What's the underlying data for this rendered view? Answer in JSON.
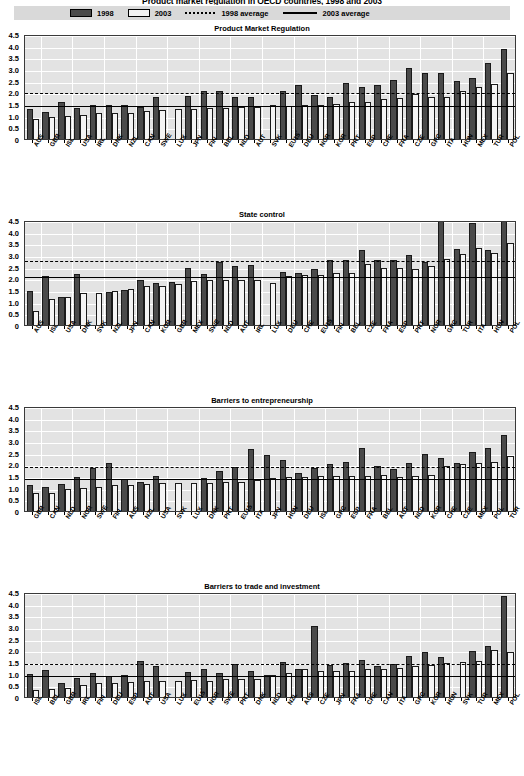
{
  "figure": {
    "title": "Product market regulation in OECD countries, 1998 and 2003",
    "y_ticks": [
      "4.5",
      "4.0",
      "3.5",
      "3.0",
      "2.5",
      "2.0",
      "1.5",
      "1.0",
      "0.5",
      "0"
    ],
    "ylim": [
      0,
      4.5
    ]
  },
  "legend": {
    "items": [
      {
        "key": "bar-1998",
        "label": "1998",
        "swatch": "dark",
        "color": "#4a4a4a"
      },
      {
        "key": "bar-2003",
        "label": "2003",
        "swatch": "light",
        "color": "#f4f4f4"
      },
      {
        "key": "avg-1998",
        "label": "1998 average",
        "swatch": "dash",
        "color": "#000000"
      },
      {
        "key": "avg-2003",
        "label": "2003 average",
        "swatch": "solid",
        "color": "#000000"
      }
    ]
  },
  "chart_data": [
    {
      "type": "bar",
      "title": "Product Market Regulation",
      "xlabel": "",
      "ylabel": "",
      "ylim": [
        0,
        4.5
      ],
      "grid": true,
      "legend_position": "top",
      "categories": [
        "AUS",
        "GBR",
        "ISL",
        "USA",
        "IRL",
        "DNK",
        "NZL",
        "CAN",
        "SWE",
        "LUX",
        "JPN",
        "FIN",
        "BEL",
        "NLD",
        "AUT",
        "SVK",
        "EU15²",
        "DEU",
        "NOR",
        "KOR",
        "PRT",
        "ESP",
        "CHE",
        "FRA",
        "CZE",
        "GRC",
        "ITA",
        "HUN",
        "MEX",
        "TUR",
        "POL"
      ],
      "series": [
        {
          "name": "1998",
          "values": [
            1.28,
            1.15,
            1.58,
            1.31,
            1.46,
            1.47,
            1.45,
            1.37,
            1.79,
            null,
            1.84,
            2.07,
            2.07,
            1.78,
            1.79,
            null,
            2.07,
            2.3,
            1.89,
            1.82,
            2.42,
            2.25,
            2.33,
            2.52,
            3.04,
            2.85,
            2.85,
            2.5,
            2.6,
            3.27,
            3.84
          ],
          "color": "#4a4a4a"
        },
        {
          "name": "2003",
          "values": [
            0.87,
            0.93,
            0.98,
            1.04,
            1.13,
            1.12,
            1.11,
            1.2,
            1.23,
            1.28,
            1.28,
            1.32,
            1.35,
            1.36,
            1.36,
            1.46,
            1.41,
            1.45,
            1.45,
            1.52,
            1.57,
            1.59,
            1.73,
            1.74,
            1.93,
            1.78,
            1.8,
            2.05,
            2.21,
            2.36,
            2.82
          ],
          "color": "#f4f4f4"
        }
      ],
      "avg_1998": 2.07,
      "avg_2003": 1.48
    },
    {
      "type": "bar",
      "title": "State control",
      "xlabel": "",
      "ylabel": "",
      "ylim": [
        0,
        4.5
      ],
      "grid": true,
      "legend_position": "top",
      "categories": [
        "AUS",
        "ISL",
        "USA",
        "DNK",
        "SVK",
        "NZL",
        "JPN",
        "CAN",
        "KOR",
        "GBR",
        "MEX",
        "SWE",
        "NLD",
        "AUT",
        "IRL",
        "LUX",
        "DEU",
        "CHE",
        "EU15²",
        "FIN",
        "BEL",
        "CZE",
        "FRA",
        "ESP",
        "PRT",
        "NOR",
        "GRC",
        "TUR",
        "ITA",
        "HUN",
        "POL"
      ],
      "series": [
        {
          "name": "1998",
          "values": [
            1.44,
            2.12,
            1.22,
            2.17,
            null,
            1.41,
            1.51,
            1.95,
            1.8,
            1.83,
            2.45,
            2.19,
            2.72,
            2.51,
            2.56,
            null,
            2.28,
            2.22,
            2.42,
            2.77,
            2.79,
            3.22,
            2.8,
            2.78,
            3.0,
            2.72,
            4.48,
            3.25,
            4.38,
            3.23,
            4.5
          ],
          "color": "#4a4a4a"
        },
        {
          "name": "2003",
          "values": [
            0.6,
            1.1,
            1.18,
            1.36,
            1.39,
            1.45,
            1.55,
            1.66,
            1.66,
            1.75,
            1.9,
            1.92,
            1.91,
            1.93,
            1.95,
            1.79,
            2.1,
            2.14,
            2.16,
            2.21,
            2.24,
            2.6,
            2.46,
            2.43,
            2.42,
            2.54,
            2.81,
            3.05,
            3.28,
            3.07,
            3.52
          ],
          "color": "#f4f4f4"
        }
      ],
      "avg_1998": 2.84,
      "avg_2003": 2.13
    },
    {
      "type": "bar",
      "title": "Barriers to entrepreneurship",
      "xlabel": "",
      "ylabel": "",
      "ylim": [
        0,
        4.5
      ],
      "grid": true,
      "legend_position": "top",
      "categories": [
        "GBR",
        "CAN",
        "NLD",
        "NOR",
        "SWE",
        "FIN",
        "AUS",
        "NZL",
        "USA",
        "SVK",
        "LUX",
        "DNK",
        "PRT",
        "EU15²",
        "ITA",
        "JPN",
        "HUN",
        "DEU",
        "ISL",
        "GRC",
        "ESP",
        "FRA",
        "BEL",
        "AUT",
        "NLD",
        "KOR",
        "CHE",
        "CZE",
        "MEX",
        "POL",
        "TUR"
      ],
      "series": [
        {
          "name": "1998",
          "values": [
            1.13,
            1.03,
            1.16,
            1.45,
            1.86,
            2.07,
            1.38,
            1.23,
            1.49,
            null,
            null,
            1.4,
            1.72,
            1.9,
            2.65,
            2.38,
            2.2,
            1.65,
            1.86,
            2.0,
            2.1,
            2.7,
            1.92,
            1.8,
            2.05,
            2.45,
            2.28,
            2.07,
            2.55,
            2.7,
            3.25
          ],
          "color": "#4a4a4a"
        },
        {
          "name": "2003",
          "values": [
            0.76,
            0.78,
            0.93,
            0.99,
            1.05,
            1.1,
            1.12,
            1.17,
            1.2,
            1.2,
            1.22,
            1.21,
            1.26,
            1.25,
            1.35,
            1.42,
            1.45,
            1.47,
            1.48,
            1.5,
            1.5,
            1.52,
            1.54,
            1.45,
            1.52,
            1.55,
            1.95,
            2.0,
            2.07,
            2.08,
            2.35
          ],
          "color": "#f4f4f4"
        }
      ],
      "avg_1998": 1.96,
      "avg_2003": 1.45
    },
    {
      "type": "bar",
      "title": "Barriers to trade and investment",
      "xlabel": "",
      "ylabel": "",
      "ylim": [
        0,
        4.5
      ],
      "grid": true,
      "legend_position": "top",
      "categories": [
        "ISL",
        "BEL",
        "GBR",
        "IRL",
        "FIN",
        "DEU",
        "ESP",
        "AUT",
        "USA",
        "LUX",
        "EU15²",
        "NOR",
        "SWE",
        "PRT",
        "DNK",
        "NLD",
        "NZL",
        "AUS",
        "CZE",
        "JPN",
        "FRA",
        "CHE",
        "CAN",
        "ITA",
        "GRC",
        "KOR",
        "HUN",
        "SVK",
        "TUR",
        "MEX",
        "POL"
      ],
      "series": [
        {
          "name": "1998",
          "values": [
            0.98,
            1.15,
            0.58,
            0.81,
            1.05,
            0.92,
            0.93,
            1.56,
            1.32,
            null,
            1.08,
            1.19,
            1.02,
            1.4,
            1.12,
            0.96,
            1.5,
            1.2,
            3.05,
            1.38,
            1.45,
            1.58,
            1.35,
            1.42,
            1.75,
            1.95,
            1.72,
            null,
            1.98,
            2.18,
            4.35
          ],
          "color": "#4a4a4a"
        },
        {
          "name": "2003",
          "values": [
            0.3,
            0.33,
            0.37,
            0.5,
            0.62,
            0.62,
            0.65,
            0.67,
            0.67,
            0.7,
            0.71,
            0.7,
            0.76,
            0.76,
            0.78,
            0.95,
            1.02,
            1.18,
            1.1,
            1.12,
            1.12,
            1.18,
            1.22,
            1.24,
            1.35,
            1.38,
            1.45,
            1.52,
            1.55,
            2.0,
            1.95
          ],
          "color": "#f4f4f4"
        }
      ],
      "avg_1998": 1.52,
      "avg_2003": 0.99
    }
  ]
}
